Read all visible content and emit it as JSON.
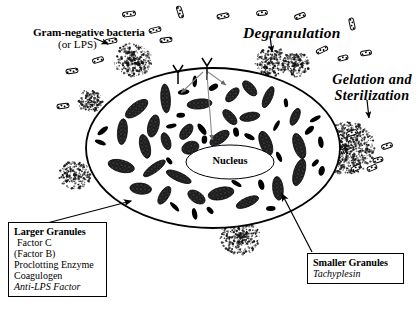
{
  "figure": {
    "title_visible": false,
    "background_color": "#ffffff",
    "ink_color": "#000000"
  },
  "labels": {
    "gram_negative": "Gram-negative bacteria",
    "or_lps": "(or LPS)",
    "degranulation": "Degranulation",
    "gelation_line1": "Gelation and",
    "gelation_line2": "Sterilization",
    "nucleus": "Nucleus"
  },
  "legend_boxes": [
    {
      "id": "larger-granules",
      "heading": "Larger Granules",
      "items": [
        {
          "text": "Factor C",
          "style": "normal"
        },
        {
          "text": "(Factor B)",
          "style": "normal"
        },
        {
          "text": "Proclotting Enzyme",
          "style": "normal"
        },
        {
          "text": "Coagulogen",
          "style": "normal"
        },
        {
          "text": "Anti-LPS Factor",
          "style": "italic"
        }
      ]
    },
    {
      "id": "smaller-granules",
      "heading": "Smaller Granules",
      "items": [
        {
          "text": "Tachyplesin",
          "style": "italic"
        }
      ]
    }
  ],
  "box_larger": {
    "heading": "Larger Granules",
    "line1": "Factor C",
    "line2": "(Factor B)",
    "line3": "Proclotting Enzyme",
    "line4": "Coagulogen",
    "line5": "Anti-LPS Factor"
  },
  "box_smaller": {
    "heading": "Smaller Granules",
    "line1": "Tachyplesin"
  },
  "diagram": {
    "type": "biological-schematic",
    "cell": {
      "shape": "ellipse",
      "center_x": 213,
      "center_y": 148,
      "radius_x": 127,
      "radius_y": 80,
      "outline_width": 1.8
    },
    "nucleus": {
      "shape": "ellipse",
      "center_x": 230,
      "center_y": 162,
      "radius_x": 44,
      "radius_y": 17
    },
    "receptors": [
      {
        "x": 178,
        "y": 70,
        "label": "membrane-receptor"
      },
      {
        "x": 207,
        "y": 63,
        "label": "membrane-receptor"
      }
    ],
    "internal_arrows": [
      {
        "from_x": 204,
        "from_y": 70,
        "to_x": 178,
        "to_y": 92
      },
      {
        "from_x": 207,
        "from_y": 70,
        "to_x": 224,
        "to_y": 84
      },
      {
        "from_x": 207,
        "from_y": 70,
        "to_x": 212,
        "to_y": 142
      }
    ],
    "clot_masses": [
      {
        "x": 133,
        "y": 60,
        "size": 19
      },
      {
        "x": 272,
        "y": 62,
        "size": 17
      },
      {
        "x": 296,
        "y": 65,
        "size": 14
      },
      {
        "x": 345,
        "y": 148,
        "size": 30
      },
      {
        "x": 90,
        "y": 101,
        "size": 13
      },
      {
        "x": 75,
        "y": 175,
        "size": 16
      },
      {
        "x": 240,
        "y": 237,
        "size": 20
      }
    ],
    "bacteria_count_outside": 17,
    "large_granule_count": 31,
    "small_granule_count": 26
  },
  "icons": {
    "bacterium": "rod-shaped-bacterium-icon",
    "receptor": "y-receptor-icon",
    "granule_large": "large-granule-icon",
    "granule_small": "small-granule-icon",
    "clot": "gel-clot-cloud-icon",
    "arrow": "arrow-icon"
  }
}
